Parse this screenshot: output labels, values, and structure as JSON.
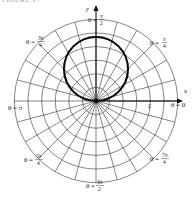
{
  "figure": {
    "header": "FIGURE 17",
    "type": "polar-graph",
    "curve": "r = 2 sin θ"
  },
  "axes": {
    "x_label": "x",
    "y_label": "y",
    "tick_label_2": "2"
  },
  "angle_labels": [
    {
      "id": "pi_over_2",
      "prefix": "θ =",
      "num": "π",
      "den": "2"
    },
    {
      "id": "pi_over_4",
      "prefix": "θ =",
      "num": "π",
      "den": "4"
    },
    {
      "id": "zero",
      "text": "θ = 0"
    },
    {
      "id": "seven_pi_over_4",
      "prefix": "θ =",
      "num": "7π",
      "den": "4"
    },
    {
      "id": "three_pi_over_2",
      "prefix": "θ =",
      "num": "3π",
      "den": "2"
    },
    {
      "id": "five_pi_over_4",
      "prefix": "θ =",
      "num": "5π",
      "den": "4"
    },
    {
      "id": "pi",
      "text": "θ = π"
    },
    {
      "id": "three_pi_over_4",
      "prefix": "θ =",
      "num": "3π",
      "den": "4"
    }
  ],
  "colors": {
    "grid": "#333333",
    "curve": "#000000",
    "text": "#222222"
  }
}
